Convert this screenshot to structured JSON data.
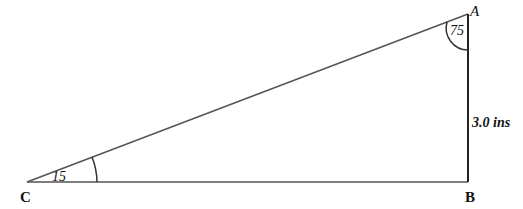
{
  "diagram": {
    "type": "right-triangle",
    "vertices": {
      "A": {
        "label": "A"
      },
      "B": {
        "label": "B"
      },
      "C": {
        "label": "C"
      }
    },
    "angles": {
      "A": "75",
      "C": "15"
    },
    "sides": {
      "AB": "3.0 ins"
    },
    "colors": {
      "stroke": "#333333",
      "text": "#111111"
    }
  }
}
